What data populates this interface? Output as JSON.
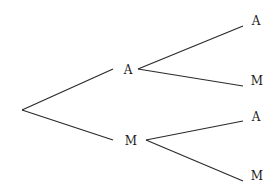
{
  "diagram": {
    "type": "probability-tree",
    "line_color": "#2a2a2a",
    "root": {
      "x": 22,
      "y": 110
    },
    "level1": [
      {
        "label": "A",
        "x": 128,
        "y": 70,
        "edge_end": {
          "x": 113,
          "y": 69
        },
        "child_start": {
          "x": 138,
          "y": 69
        }
      },
      {
        "label": "M",
        "x": 131,
        "y": 141,
        "edge_end": {
          "x": 113,
          "y": 140
        },
        "child_start": {
          "x": 146,
          "y": 140
        }
      }
    ],
    "level2": [
      {
        "label": "A",
        "x": 256,
        "y": 21,
        "edge_end": {
          "x": 243,
          "y": 26
        },
        "parent": 0
      },
      {
        "label": "M",
        "x": 257,
        "y": 81,
        "edge_end": {
          "x": 243,
          "y": 86
        },
        "parent": 0
      },
      {
        "label": "A",
        "x": 256,
        "y": 117,
        "edge_end": {
          "x": 243,
          "y": 121
        },
        "parent": 1
      },
      {
        "label": "M",
        "x": 257,
        "y": 176,
        "edge_end": {
          "x": 243,
          "y": 181
        },
        "parent": 1
      }
    ]
  }
}
